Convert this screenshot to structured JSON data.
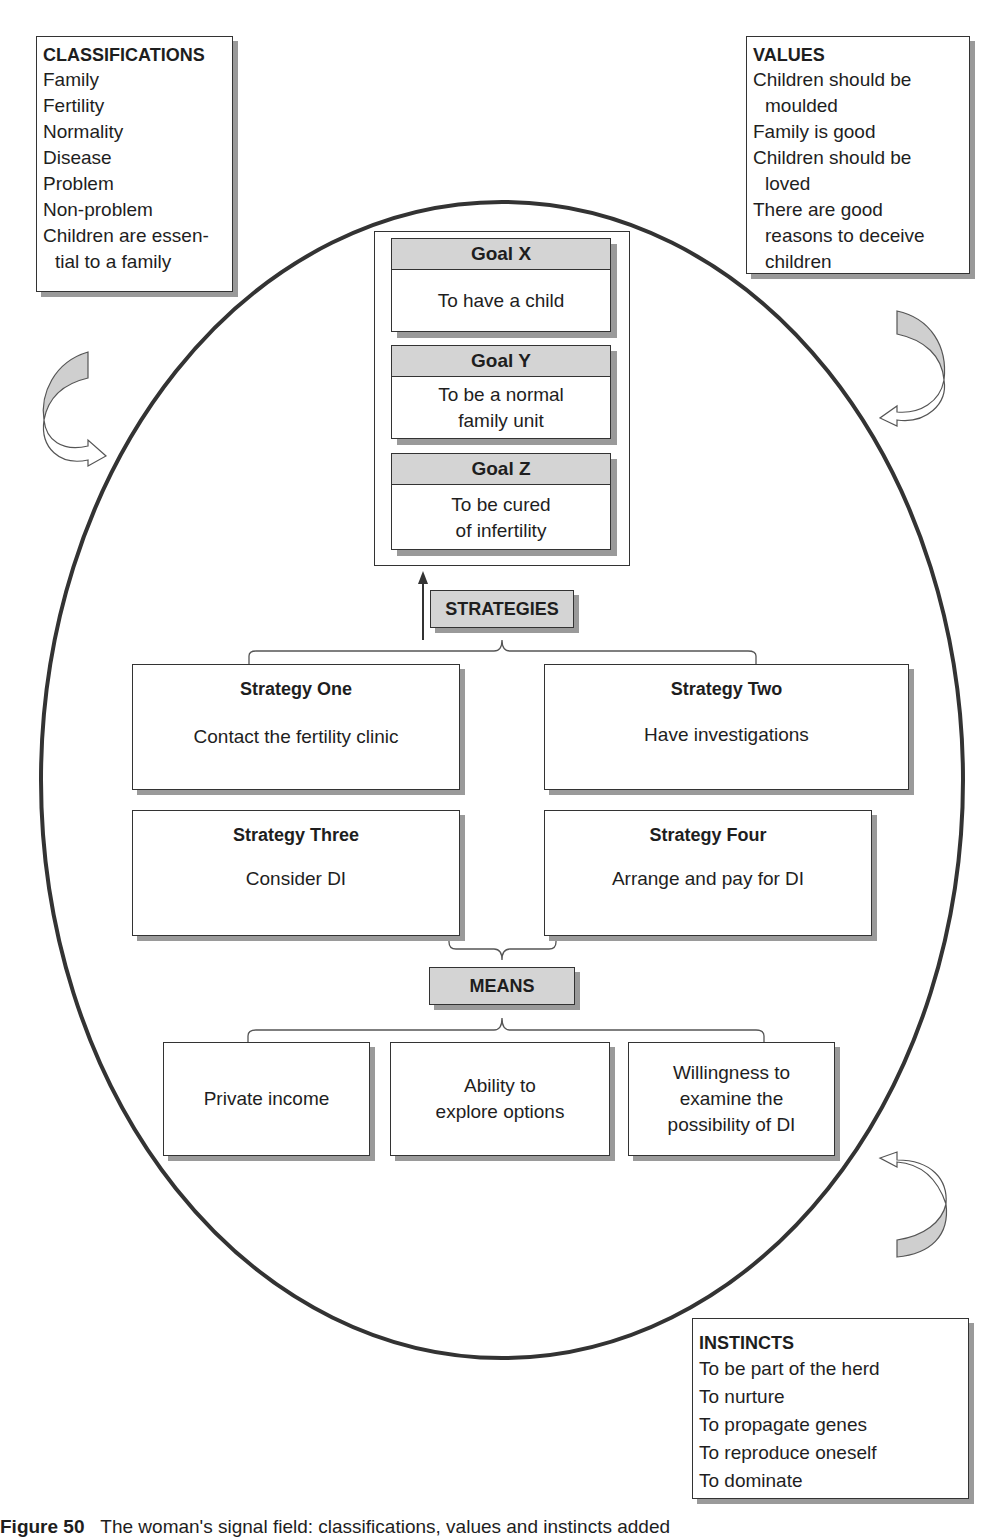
{
  "classifications": {
    "title": "CLASSIFICATIONS",
    "items": [
      "Family",
      "Fertility",
      "Normality",
      "Disease",
      "Problem",
      "Non-problem"
    ],
    "last_item_line1": "Children are essen-",
    "last_item_line2": "tial to a family"
  },
  "values": {
    "title": "VALUES",
    "items": [
      {
        "line1": "Children should be",
        "line2": "moulded"
      },
      {
        "line1": "Family is good",
        "line2": ""
      },
      {
        "line1": "Children should be",
        "line2": "loved"
      },
      {
        "line1": "There are good",
        "line2": "reasons to deceive",
        "line3": "children"
      }
    ]
  },
  "goals": [
    {
      "title": "Goal X",
      "line1": "To have a child",
      "line2": ""
    },
    {
      "title": "Goal Y",
      "line1": "To be a normal",
      "line2": "family unit"
    },
    {
      "title": "Goal Z",
      "line1": "To be cured",
      "line2": "of infertility"
    }
  ],
  "strategies_label": "STRATEGIES",
  "strategies": [
    {
      "title": "Strategy One",
      "text": "Contact the fertility clinic"
    },
    {
      "title": "Strategy Two",
      "text": "Have investigations"
    },
    {
      "title": "Strategy Three",
      "text": "Consider DI"
    },
    {
      "title": "Strategy Four",
      "text": "Arrange and pay for DI"
    }
  ],
  "means_label": "MEANS",
  "means": [
    {
      "line1": "Private income",
      "line2": "",
      "line3": ""
    },
    {
      "line1": "Ability to",
      "line2": "explore options",
      "line3": ""
    },
    {
      "line1": "Willingness to",
      "line2": "examine the",
      "line3": "possibility of DI"
    }
  ],
  "instincts": {
    "title": "INSTINCTS",
    "items": [
      "To be part of the herd",
      "To nurture",
      "To propagate genes",
      "To reproduce oneself",
      "To dominate"
    ]
  },
  "caption": {
    "label": "Figure 50",
    "text": "The woman's signal field: classifications, values and instincts added"
  },
  "colors": {
    "header_fill": "#d4d4d4",
    "shadow": "#9a9a9a",
    "stroke": "#333333",
    "arrow_fill": "#cfcfcf"
  }
}
